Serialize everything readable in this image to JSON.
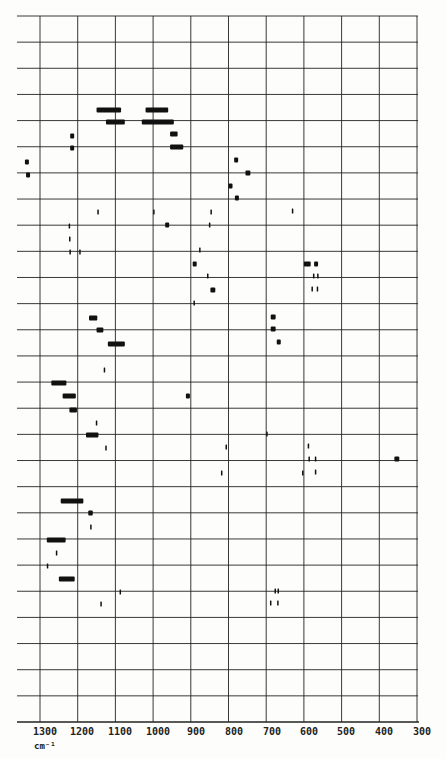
{
  "chart_data": {
    "type": "scatter",
    "title": "",
    "xlabel": "cm⁻¹",
    "ylabel": "",
    "xlim": [
      1340,
      300
    ],
    "x_reversed": true,
    "grid": true,
    "x_ticks": [
      1300,
      1200,
      1100,
      1000,
      900,
      800,
      700,
      600,
      500,
      400,
      300
    ],
    "x_tick_labels": [
      "1300",
      "1200",
      "1100",
      "1000",
      "900",
      "800",
      "700",
      "600",
      "500",
      "400",
      "300"
    ],
    "row_count": 27,
    "note": "Each mark is a band/range (x1–x2 in cm⁻¹) drawn at a row position (pixel y). Thin ticks = weak bands, thick bars = strong bands.",
    "marks": [
      {
        "x1": 1150,
        "x2": 1085,
        "y": 110,
        "w": "bar"
      },
      {
        "x1": 1020,
        "x2": 960,
        "y": 110,
        "w": "bar"
      },
      {
        "x1": 1125,
        "x2": 1075,
        "y": 122,
        "w": "bar"
      },
      {
        "x1": 1030,
        "x2": 945,
        "y": 122,
        "w": "bar"
      },
      {
        "x1": 1220,
        "x2": 1210,
        "y": 136,
        "w": "dot"
      },
      {
        "x1": 955,
        "x2": 935,
        "y": 134,
        "w": "bar"
      },
      {
        "x1": 1220,
        "x2": 1210,
        "y": 148,
        "w": "dot"
      },
      {
        "x1": 955,
        "x2": 920,
        "y": 147,
        "w": "bar"
      },
      {
        "x1": 1340,
        "x2": 1330,
        "y": 162,
        "w": "dot"
      },
      {
        "x1": 785,
        "x2": 778,
        "y": 160,
        "w": "dot"
      },
      {
        "x1": 1337,
        "x2": 1328,
        "y": 175,
        "w": "dot"
      },
      {
        "x1": 755,
        "x2": 742,
        "y": 173,
        "w": "dot"
      },
      {
        "x1": 800,
        "x2": 790,
        "y": 186,
        "w": "dot"
      },
      {
        "x1": 783,
        "x2": 773,
        "y": 198,
        "w": "dot"
      },
      {
        "x1": 1148,
        "x2": 1145,
        "y": 212,
        "w": "tick"
      },
      {
        "x1": 1000,
        "x2": 997,
        "y": 212,
        "w": "tick"
      },
      {
        "x1": 848,
        "x2": 845,
        "y": 212,
        "w": "tick"
      },
      {
        "x1": 632,
        "x2": 629,
        "y": 211,
        "w": "tick"
      },
      {
        "x1": 1224,
        "x2": 1221,
        "y": 226,
        "w": "tick"
      },
      {
        "x1": 968,
        "x2": 962,
        "y": 225,
        "w": "dot"
      },
      {
        "x1": 852,
        "x2": 849,
        "y": 225,
        "w": "tick"
      },
      {
        "x1": 1223,
        "x2": 1220,
        "y": 239,
        "w": "tick"
      },
      {
        "x1": 1222,
        "x2": 1219,
        "y": 252,
        "w": "tick"
      },
      {
        "x1": 1196,
        "x2": 1193,
        "y": 252,
        "w": "tick"
      },
      {
        "x1": 878,
        "x2": 875,
        "y": 250,
        "w": "tick"
      },
      {
        "x1": 600,
        "x2": 582,
        "y": 264,
        "w": "bar"
      },
      {
        "x1": 573,
        "x2": 563,
        "y": 264,
        "w": "dot"
      },
      {
        "x1": 895,
        "x2": 885,
        "y": 264,
        "w": "dot"
      },
      {
        "x1": 857,
        "x2": 854,
        "y": 276,
        "w": "tick"
      },
      {
        "x1": 576,
        "x2": 573,
        "y": 276,
        "w": "tick"
      },
      {
        "x1": 565,
        "x2": 562,
        "y": 276,
        "w": "tick"
      },
      {
        "x1": 848,
        "x2": 835,
        "y": 290,
        "w": "dot"
      },
      {
        "x1": 580,
        "x2": 577,
        "y": 289,
        "w": "tick"
      },
      {
        "x1": 566,
        "x2": 563,
        "y": 289,
        "w": "tick"
      },
      {
        "x1": 893,
        "x2": 890,
        "y": 303,
        "w": "tick"
      },
      {
        "x1": 1170,
        "x2": 1148,
        "y": 318,
        "w": "bar"
      },
      {
        "x1": 1150,
        "x2": 1132,
        "y": 330,
        "w": "bar"
      },
      {
        "x1": 1120,
        "x2": 1075,
        "y": 344,
        "w": "bar"
      },
      {
        "x1": 688,
        "x2": 675,
        "y": 317,
        "w": "dot"
      },
      {
        "x1": 688,
        "x2": 675,
        "y": 329,
        "w": "dot"
      },
      {
        "x1": 672,
        "x2": 662,
        "y": 342,
        "w": "dot"
      },
      {
        "x1": 1131,
        "x2": 1128,
        "y": 370,
        "w": "tick"
      },
      {
        "x1": 1270,
        "x2": 1230,
        "y": 383,
        "w": "bar"
      },
      {
        "x1": 1240,
        "x2": 1205,
        "y": 396,
        "w": "bar"
      },
      {
        "x1": 913,
        "x2": 903,
        "y": 396,
        "w": "dot"
      },
      {
        "x1": 1222,
        "x2": 1202,
        "y": 410,
        "w": "bar"
      },
      {
        "x1": 1152,
        "x2": 1149,
        "y": 423,
        "w": "tick"
      },
      {
        "x1": 1178,
        "x2": 1145,
        "y": 435,
        "w": "bar"
      },
      {
        "x1": 700,
        "x2": 697,
        "y": 434,
        "w": "tick"
      },
      {
        "x1": 1127,
        "x2": 1124,
        "y": 448,
        "w": "tick"
      },
      {
        "x1": 808,
        "x2": 805,
        "y": 447,
        "w": "tick"
      },
      {
        "x1": 590,
        "x2": 587,
        "y": 446,
        "w": "tick"
      },
      {
        "x1": 588,
        "x2": 585,
        "y": 459,
        "w": "tick"
      },
      {
        "x1": 571,
        "x2": 568,
        "y": 459,
        "w": "tick"
      },
      {
        "x1": 360,
        "x2": 347,
        "y": 459,
        "w": "dot"
      },
      {
        "x1": 820,
        "x2": 817,
        "y": 473,
        "w": "tick"
      },
      {
        "x1": 605,
        "x2": 602,
        "y": 473,
        "w": "tick"
      },
      {
        "x1": 571,
        "x2": 568,
        "y": 472,
        "w": "tick"
      },
      {
        "x1": 1245,
        "x2": 1185,
        "y": 501,
        "w": "bar"
      },
      {
        "x1": 1172,
        "x2": 1160,
        "y": 513,
        "w": "dot"
      },
      {
        "x1": 1167,
        "x2": 1164,
        "y": 527,
        "w": "tick"
      },
      {
        "x1": 1282,
        "x2": 1232,
        "y": 540,
        "w": "bar"
      },
      {
        "x1": 1258,
        "x2": 1255,
        "y": 553,
        "w": "tick"
      },
      {
        "x1": 1282,
        "x2": 1279,
        "y": 566,
        "w": "tick"
      },
      {
        "x1": 1250,
        "x2": 1208,
        "y": 579,
        "w": "bar"
      },
      {
        "x1": 1089,
        "x2": 1086,
        "y": 592,
        "w": "tick"
      },
      {
        "x1": 678,
        "x2": 675,
        "y": 591,
        "w": "tick"
      },
      {
        "x1": 670,
        "x2": 667,
        "y": 591,
        "w": "tick"
      },
      {
        "x1": 1140,
        "x2": 1137,
        "y": 604,
        "w": "tick"
      },
      {
        "x1": 690,
        "x2": 687,
        "y": 603,
        "w": "tick"
      },
      {
        "x1": 671,
        "x2": 668,
        "y": 603,
        "w": "tick"
      }
    ],
    "colors": {
      "grid": "#222222",
      "marks": "#111111",
      "background": "#fdfdfb"
    }
  },
  "axis": {
    "unit_label": "cm⁻¹",
    "tick_labels": [
      "1300",
      "1200",
      "1100",
      "1000",
      "900",
      "800",
      "700",
      "600",
      "500",
      "400",
      "300"
    ]
  }
}
